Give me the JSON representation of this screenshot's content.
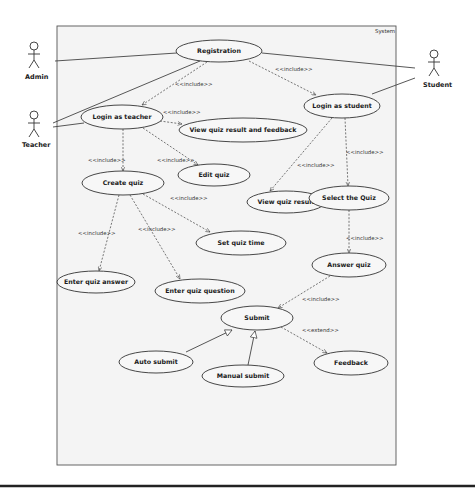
{
  "diagram": {
    "type": "UML use case diagram",
    "system_boundary": {
      "label": "System",
      "x": 57,
      "y": 26,
      "w": 104,
      "h": 137
    },
    "actors": [
      {
        "id": "admin",
        "label": "Admin",
        "x": 34,
        "y": 47
      },
      {
        "id": "teacher",
        "label": "Teacher",
        "x": 34,
        "y": 118
      },
      {
        "id": "student",
        "label": "Student",
        "x": 435,
        "y": 60
      }
    ],
    "use_cases": [
      {
        "id": "registration",
        "label": "Registration",
        "cx": 219,
        "cy": 51,
        "rx": 43,
        "ry": 11
      },
      {
        "id": "login_teacher",
        "label": "Login as teacher",
        "cx": 122,
        "cy": 117,
        "rx": 41,
        "ry": 12
      },
      {
        "id": "view_result_feedback",
        "label": "View quiz result and feedback",
        "cx": 243,
        "cy": 130,
        "rx": 64,
        "ry": 12
      },
      {
        "id": "login_student",
        "label": "Login as student",
        "cx": 342,
        "cy": 106,
        "rx": 38,
        "ry": 12
      },
      {
        "id": "edit_quiz",
        "label": "Edit quiz",
        "cx": 214,
        "cy": 175,
        "rx": 36,
        "ry": 11
      },
      {
        "id": "create_quiz",
        "label": "Create quiz",
        "cx": 123,
        "cy": 183,
        "rx": 41,
        "ry": 12
      },
      {
        "id": "view_result",
        "label": "View quiz result",
        "cx": 286,
        "cy": 202,
        "rx": 39,
        "ry": 11
      },
      {
        "id": "select_quiz",
        "label": "Select the Quiz",
        "cx": 349,
        "cy": 198,
        "rx": 40,
        "ry": 12
      },
      {
        "id": "set_time",
        "label": "Set quiz time",
        "cx": 241,
        "cy": 243,
        "rx": 45,
        "ry": 12
      },
      {
        "id": "answer_quiz",
        "label": "Answer quiz",
        "cx": 349,
        "cy": 265,
        "rx": 37,
        "ry": 12
      },
      {
        "id": "enter_answer",
        "label": "Enter quiz answer",
        "cx": 96,
        "cy": 282,
        "rx": 39,
        "ry": 11
      },
      {
        "id": "enter_question",
        "label": "Enter quiz question",
        "cx": 200,
        "cy": 291,
        "rx": 45,
        "ry": 12
      },
      {
        "id": "submit",
        "label": "Submit",
        "cx": 257,
        "cy": 318,
        "rx": 36,
        "ry": 12
      },
      {
        "id": "feedback",
        "label": "Feedback",
        "cx": 351,
        "cy": 363,
        "rx": 37,
        "ry": 12
      },
      {
        "id": "auto_submit",
        "label": "Auto submit",
        "cx": 156,
        "cy": 362,
        "rx": 37,
        "ry": 11
      },
      {
        "id": "manual_submit",
        "label": "Manual submit",
        "cx": 243,
        "cy": 376,
        "rx": 41,
        "ry": 11
      }
    ],
    "relationships": [
      {
        "type": "association",
        "from": "admin",
        "to": "registration"
      },
      {
        "type": "association",
        "from": "teacher",
        "to": "registration"
      },
      {
        "type": "association",
        "from": "teacher",
        "to": "login_teacher"
      },
      {
        "type": "association",
        "from": "student",
        "to": "registration"
      },
      {
        "type": "association",
        "from": "student",
        "to": "login_student"
      },
      {
        "type": "include",
        "label": "<<include>>",
        "from": "registration",
        "to": "login_teacher"
      },
      {
        "type": "include",
        "label": "<<include>>",
        "from": "registration",
        "to": "login_student"
      },
      {
        "type": "include",
        "label": "<<include>>",
        "from": "login_teacher",
        "to": "view_result_feedback"
      },
      {
        "type": "include",
        "label": "<<include>>",
        "from": "login_teacher",
        "to": "create_quiz"
      },
      {
        "type": "include",
        "label": "<<include>>",
        "from": "login_teacher",
        "to": "edit_quiz"
      },
      {
        "type": "include",
        "label": "<<include>>",
        "from": "create_quiz",
        "to": "set_time"
      },
      {
        "type": "include",
        "label": "<<include>>",
        "from": "create_quiz",
        "to": "enter_answer"
      },
      {
        "type": "include",
        "label": "<<include>>",
        "from": "create_quiz",
        "to": "enter_question"
      },
      {
        "type": "include",
        "label": "<<include>>",
        "from": "login_student",
        "to": "view_result"
      },
      {
        "type": "include",
        "label": "<<include>>",
        "from": "login_student",
        "to": "select_quiz"
      },
      {
        "type": "include",
        "label": "<<include>>",
        "from": "select_quiz",
        "to": "answer_quiz"
      },
      {
        "type": "include",
        "label": "<<include>>",
        "from": "answer_quiz",
        "to": "submit"
      },
      {
        "type": "extend",
        "label": "<<extend>>",
        "from": "submit",
        "to": "feedback"
      },
      {
        "type": "generalization",
        "from": "auto_submit",
        "to": "submit"
      },
      {
        "type": "generalization",
        "from": "manual_submit",
        "to": "submit"
      }
    ]
  },
  "labels": {
    "system": "System",
    "admin": "Admin",
    "teacher": "Teacher",
    "student": "Student",
    "registration": "Registration",
    "login_teacher": "Login as teacher",
    "view_result_feedback": "View quiz result and feedback",
    "login_student": "Login as student",
    "edit_quiz": "Edit quiz",
    "create_quiz": "Create quiz",
    "view_result": "View quiz result",
    "select_quiz": "Select the Quiz",
    "set_time": "Set quiz time",
    "answer_quiz": "Answer quiz",
    "enter_answer": "Enter quiz answer",
    "enter_question": "Enter quiz question",
    "submit": "Submit",
    "feedback": "Feedback",
    "auto_submit": "Auto submit",
    "manual_submit": "Manual submit",
    "include": "<<include>>",
    "extend": "<<extend>>"
  }
}
